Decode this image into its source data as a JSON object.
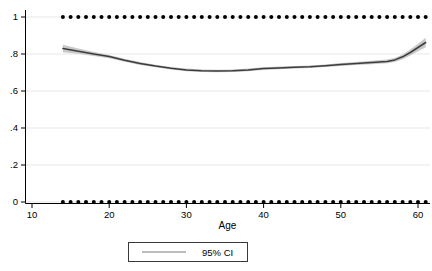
{
  "chart_data": {
    "type": "line",
    "title": "",
    "xlabel": "Age",
    "ylabel": "",
    "grid": true,
    "x_axis": {
      "ticks": [
        10,
        20,
        30,
        40,
        50,
        60
      ],
      "range": [
        9,
        61.5
      ]
    },
    "y_axis": {
      "ticks": [
        0,
        0.2,
        0.4,
        0.6,
        0.8,
        1
      ],
      "tick_labels": [
        "0",
        ".2",
        ".4",
        ".6",
        ".8",
        "1"
      ],
      "range": [
        0,
        1
      ]
    },
    "legend": {
      "position": "bottom-center",
      "entries": [
        {
          "label": "95% CI",
          "sample_color": "#bdbdbd"
        }
      ]
    },
    "colors": {
      "smooth_line": "#3d3d3d",
      "ci_band": "#c8c8c8",
      "scatter": "#000000",
      "gridline": "#e7e7e7",
      "axis": "#000000",
      "background": "#ffffff"
    },
    "scatter": {
      "marker": "filled-circle",
      "marker_radius": 2,
      "age_start": 14,
      "age_end": 61,
      "age_step": 1,
      "rows": [
        1,
        0
      ]
    },
    "smooth": {
      "ages": [
        14,
        16,
        18,
        20,
        22,
        24,
        26,
        28,
        30,
        32,
        34,
        36,
        38,
        40,
        42,
        44,
        46,
        48,
        50,
        52,
        54,
        56,
        57,
        58,
        59,
        60,
        61
      ],
      "values": [
        0.83,
        0.815,
        0.8,
        0.786,
        0.766,
        0.749,
        0.735,
        0.723,
        0.714,
        0.71,
        0.708,
        0.709,
        0.714,
        0.721,
        0.725,
        0.728,
        0.731,
        0.737,
        0.743,
        0.749,
        0.754,
        0.76,
        0.768,
        0.785,
        0.808,
        0.835,
        0.862
      ],
      "ci_halfwidth": [
        0.02,
        0.014,
        0.011,
        0.009,
        0.008,
        0.008,
        0.007,
        0.007,
        0.007,
        0.007,
        0.007,
        0.007,
        0.007,
        0.007,
        0.007,
        0.007,
        0.007,
        0.007,
        0.008,
        0.008,
        0.009,
        0.01,
        0.011,
        0.013,
        0.016,
        0.02,
        0.026
      ]
    }
  }
}
